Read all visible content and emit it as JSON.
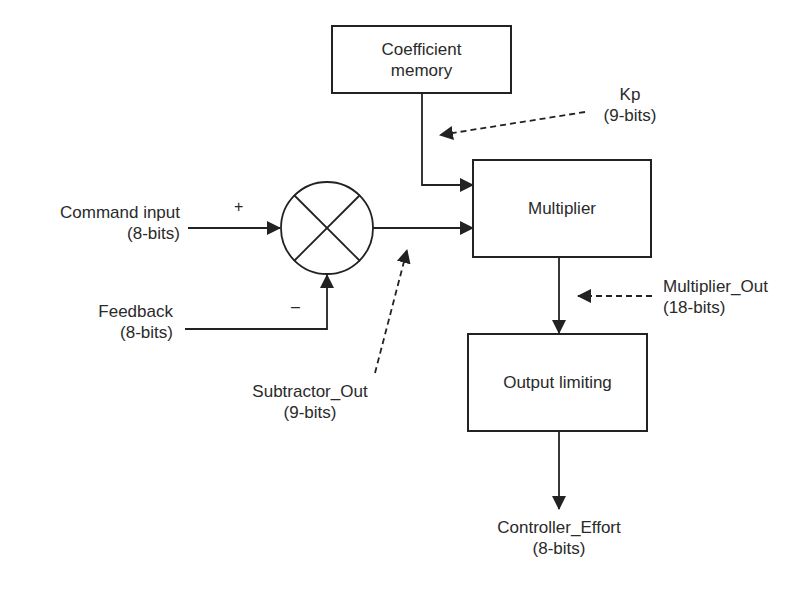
{
  "diagram": {
    "blocks": {
      "coefficient_memory": {
        "line1": "Coefficient",
        "line2": "memory"
      },
      "multiplier": {
        "label": "Multiplier"
      },
      "output_limiting": {
        "label": "Output limiting"
      },
      "subtractor": {
        "symbol": "summing-junction-x"
      }
    },
    "signals": {
      "command_input": {
        "name": "Command input",
        "width": "(8-bits)",
        "sign": "+"
      },
      "feedback": {
        "name": "Feedback",
        "width": "(8-bits)",
        "sign": "–"
      },
      "kp": {
        "name": "Kp",
        "width": "(9-bits)"
      },
      "subtractor_out": {
        "name": "Subtractor_Out",
        "width": "(9-bits)"
      },
      "multiplier_out": {
        "name": "Multiplier_Out",
        "width": "(18-bits)"
      },
      "controller_effort": {
        "name": "Controller_Effort",
        "width": "(8-bits)"
      }
    },
    "colors": {
      "line": "#222222",
      "background": "#ffffff",
      "text": "#2a2a2a"
    }
  }
}
